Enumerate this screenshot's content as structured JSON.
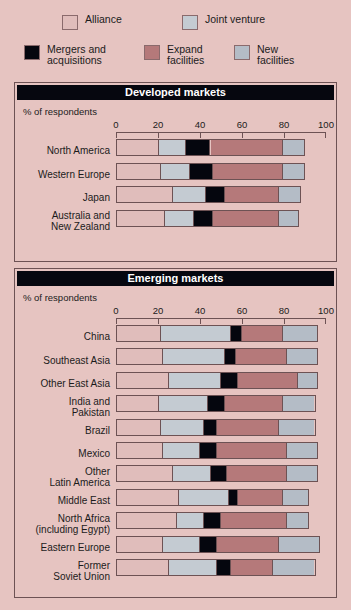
{
  "colors": {
    "background": "#e6c4c1",
    "border": "#6d5254",
    "title_bar": "#06070f",
    "title_text": "#ffffff",
    "alliance": "#e0bdbb",
    "joint_venture": "#c4cbd2",
    "mergers_acquisitions": "#05060e",
    "expand_facilities": "#b5797a",
    "new_facilities": "#b4bcc6"
  },
  "legend": {
    "items": [
      {
        "label": "Alliance",
        "key": "alliance"
      },
      {
        "label": "Joint venture",
        "key": "joint_venture"
      },
      {
        "label": "Mergers and\nacquisitions",
        "key": "mergers_acquisitions"
      },
      {
        "label": "Expand\nfacilities",
        "key": "expand_facilities"
      },
      {
        "label": "New\nfacilities",
        "key": "new_facilities"
      }
    ]
  },
  "chart_data": {
    "type": "bar",
    "orientation": "horizontal",
    "stacked": true,
    "title": "",
    "xlabel": "% of respondents",
    "ylabel": "",
    "xlim": [
      0,
      100
    ],
    "xticks": [
      0,
      20,
      40,
      60,
      80,
      100
    ],
    "xticklabels": [
      "0",
      "20",
      "40",
      "60",
      "80",
      "100"
    ],
    "grid": false,
    "legend_position": "top",
    "series": [
      {
        "name": "Alliance",
        "color": "#e0bdbb"
      },
      {
        "name": "Joint venture",
        "color": "#c4cbd2"
      },
      {
        "name": "Mergers and acquisitions",
        "color": "#05060e"
      },
      {
        "name": "Expand facilities",
        "color": "#b5797a"
      },
      {
        "name": "New facilities",
        "color": "#b4bcc6"
      }
    ],
    "panels": [
      {
        "title": "Developed markets",
        "axis_caption": "% of respondents",
        "categories": [
          "North America",
          "Western Europe",
          "Japan",
          "Australia and\nNew Zealand"
        ],
        "values": [
          [
            20,
            13,
            12,
            35,
            10
          ],
          [
            21,
            14,
            11,
            34,
            10
          ],
          [
            27,
            16,
            9,
            26,
            10
          ],
          [
            23,
            14,
            9,
            32,
            9
          ]
        ]
      },
      {
        "title": "Emerging markets",
        "axis_caption": "% of respondents",
        "categories": [
          "China",
          "Southeast Asia",
          "Other East Asia",
          "India and\nPakistan",
          "Brazil",
          "Mexico",
          "Other\nLatin America",
          "Middle East",
          "North Africa\n(including Egypt)",
          "Eastern Europe",
          "Former\nSoviet Union"
        ],
        "values": [
          [
            21,
            34,
            5,
            20,
            16
          ],
          [
            22,
            30,
            5,
            25,
            14
          ],
          [
            25,
            25,
            8,
            29,
            9
          ],
          [
            20,
            24,
            8,
            28,
            15
          ],
          [
            21,
            21,
            6,
            30,
            17
          ],
          [
            22,
            18,
            8,
            34,
            14
          ],
          [
            27,
            18,
            8,
            29,
            14
          ],
          [
            30,
            24,
            4,
            22,
            12
          ],
          [
            29,
            13,
            8,
            32,
            10
          ],
          [
            22,
            18,
            8,
            30,
            19
          ],
          [
            25,
            23,
            7,
            20,
            20
          ]
        ]
      }
    ]
  }
}
